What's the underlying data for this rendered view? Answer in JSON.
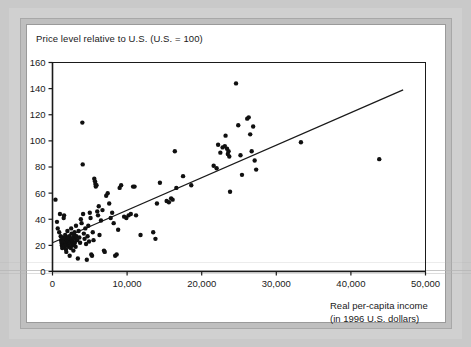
{
  "figure": {
    "title": "Price level relative to U.S. (U.S. = 100)",
    "xlabel_line1": "Real per-capita income",
    "xlabel_line2": "(in 1996 U.S. dollars)",
    "ink_color": "#1a1a1a",
    "page_color": "#ffffff",
    "border_color": "#bfbfbf"
  },
  "chart_data": {
    "type": "scatter",
    "title": "Price level relative to U.S. (U.S. = 100)",
    "xlabel": "Real per-capita income (in 1996 U.S. dollars)",
    "ylabel": "Price level relative to U.S. (U.S. = 100)",
    "xlim": [
      0,
      50000
    ],
    "ylim": [
      0,
      160
    ],
    "xticks": [
      0,
      10000,
      20000,
      30000,
      40000,
      50000
    ],
    "xticklabels": [
      "0",
      "10,000",
      "20,000",
      "30,000",
      "40,000",
      "50,000"
    ],
    "yticks": [
      0,
      20,
      40,
      60,
      80,
      100,
      120,
      140,
      160
    ],
    "yticklabels": [
      "0",
      "20",
      "40",
      "60",
      "80",
      "100",
      "120",
      "140",
      "160"
    ],
    "grid": false,
    "legend": false,
    "marker": "filled-circle",
    "marker_color": "#101010",
    "marker_size_px": 4.4,
    "trendline": {
      "label": "regression line",
      "color": "#1a1a1a",
      "x_start": 0,
      "y_start": 22,
      "x_end": 47000,
      "y_end": 139
    },
    "points": [
      [
        400,
        55
      ],
      [
        600,
        38
      ],
      [
        700,
        33
      ],
      [
        900,
        30
      ],
      [
        1000,
        44
      ],
      [
        1100,
        27
      ],
      [
        1150,
        24
      ],
      [
        1200,
        22
      ],
      [
        1250,
        20
      ],
      [
        1300,
        18
      ],
      [
        1350,
        26
      ],
      [
        1400,
        21
      ],
      [
        1450,
        23
      ],
      [
        1500,
        41
      ],
      [
        1550,
        43
      ],
      [
        1600,
        19
      ],
      [
        1650,
        25
      ],
      [
        1700,
        28
      ],
      [
        1750,
        22
      ],
      [
        1800,
        17
      ],
      [
        1850,
        15
      ],
      [
        1900,
        20
      ],
      [
        1950,
        24
      ],
      [
        2000,
        31
      ],
      [
        2050,
        26
      ],
      [
        2100,
        23
      ],
      [
        2150,
        21
      ],
      [
        2200,
        19
      ],
      [
        2250,
        27
      ],
      [
        2300,
        12
      ],
      [
        2350,
        22
      ],
      [
        2400,
        25
      ],
      [
        2450,
        18
      ],
      [
        2500,
        33
      ],
      [
        2550,
        29
      ],
      [
        2600,
        24
      ],
      [
        2650,
        20
      ],
      [
        2700,
        23
      ],
      [
        2750,
        26
      ],
      [
        2800,
        16
      ],
      [
        2850,
        21
      ],
      [
        2900,
        28
      ],
      [
        2950,
        30
      ],
      [
        3000,
        22
      ],
      [
        3050,
        25
      ],
      [
        3100,
        19
      ],
      [
        3150,
        35
      ],
      [
        3200,
        27
      ],
      [
        3300,
        24
      ],
      [
        3400,
        10
      ],
      [
        3500,
        31
      ],
      [
        3600,
        26
      ],
      [
        3700,
        22
      ],
      [
        3800,
        40
      ],
      [
        3900,
        37
      ],
      [
        4000,
        114
      ],
      [
        4050,
        82
      ],
      [
        4100,
        44
      ],
      [
        4200,
        29
      ],
      [
        4300,
        25
      ],
      [
        4400,
        33
      ],
      [
        4500,
        21
      ],
      [
        4600,
        9
      ],
      [
        4700,
        27
      ],
      [
        4800,
        35
      ],
      [
        4900,
        23
      ],
      [
        5000,
        45
      ],
      [
        5100,
        41
      ],
      [
        5200,
        13
      ],
      [
        5300,
        12
      ],
      [
        5400,
        30
      ],
      [
        5500,
        24
      ],
      [
        5600,
        71
      ],
      [
        5700,
        69
      ],
      [
        5750,
        67
      ],
      [
        5800,
        65
      ],
      [
        5900,
        66
      ],
      [
        6000,
        46
      ],
      [
        6100,
        43
      ],
      [
        6200,
        50
      ],
      [
        6300,
        28
      ],
      [
        6500,
        39
      ],
      [
        6700,
        47
      ],
      [
        6900,
        16
      ],
      [
        7000,
        15
      ],
      [
        7200,
        58
      ],
      [
        7400,
        60
      ],
      [
        7600,
        52
      ],
      [
        7800,
        41
      ],
      [
        8000,
        45
      ],
      [
        8200,
        37
      ],
      [
        8400,
        12
      ],
      [
        8600,
        13
      ],
      [
        8800,
        32
      ],
      [
        9000,
        64
      ],
      [
        9200,
        66
      ],
      [
        9600,
        42
      ],
      [
        9900,
        41
      ],
      [
        10200,
        43
      ],
      [
        10500,
        44
      ],
      [
        10800,
        65
      ],
      [
        11000,
        65
      ],
      [
        11200,
        43
      ],
      [
        11800,
        28
      ],
      [
        13500,
        30
      ],
      [
        13800,
        25
      ],
      [
        14000,
        52
      ],
      [
        14400,
        68
      ],
      [
        15300,
        54
      ],
      [
        15600,
        53
      ],
      [
        15900,
        56
      ],
      [
        16100,
        55
      ],
      [
        16400,
        92
      ],
      [
        16600,
        64
      ],
      [
        17500,
        73
      ],
      [
        18600,
        66
      ],
      [
        21600,
        81
      ],
      [
        22000,
        79
      ],
      [
        22200,
        97
      ],
      [
        22500,
        91
      ],
      [
        22800,
        95
      ],
      [
        23100,
        96
      ],
      [
        23200,
        104
      ],
      [
        23400,
        94
      ],
      [
        23500,
        90
      ],
      [
        23600,
        92
      ],
      [
        23700,
        88
      ],
      [
        23800,
        61
      ],
      [
        24600,
        144
      ],
      [
        24900,
        112
      ],
      [
        25200,
        89
      ],
      [
        25400,
        74
      ],
      [
        26100,
        117
      ],
      [
        26300,
        118
      ],
      [
        26500,
        105
      ],
      [
        26700,
        92
      ],
      [
        26900,
        111
      ],
      [
        27100,
        85
      ],
      [
        27300,
        78
      ],
      [
        33300,
        99
      ],
      [
        43800,
        86
      ]
    ]
  }
}
